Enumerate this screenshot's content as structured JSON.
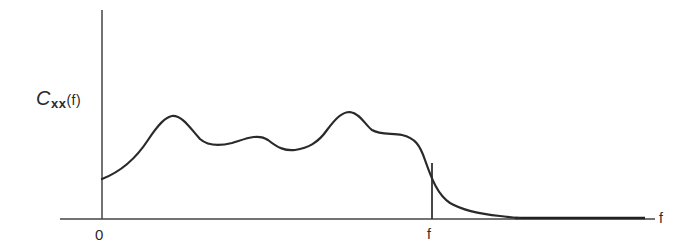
{
  "diagram": {
    "y_axis_label": {
      "symbol": "C",
      "subscript": "xx",
      "argument": "(f)"
    },
    "x_axis_label": "f",
    "origin_label": "0",
    "cutoff_label": "f"
  },
  "colors": {
    "line": "#2a2a2a",
    "background": "#ffffff"
  }
}
